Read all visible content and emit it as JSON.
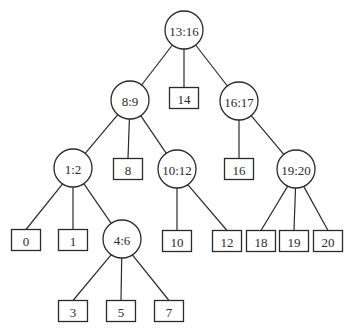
{
  "diagram": {
    "type": "tree",
    "colors": {
      "stroke": "#2a2a2a",
      "text": "#2a2a2a",
      "fill": "#ffffff",
      "background": "#ffffff"
    },
    "nodes": [
      {
        "id": "n13_16",
        "label": "13:16",
        "shape": "circle"
      },
      {
        "id": "n8_9",
        "label": "8:9",
        "shape": "circle"
      },
      {
        "id": "n14",
        "label": "14",
        "shape": "box"
      },
      {
        "id": "n16_17",
        "label": "16:17",
        "shape": "circle"
      },
      {
        "id": "n1_2",
        "label": "1:2",
        "shape": "circle"
      },
      {
        "id": "n8",
        "label": "8",
        "shape": "box"
      },
      {
        "id": "n10_12",
        "label": "10:12",
        "shape": "circle"
      },
      {
        "id": "n16",
        "label": "16",
        "shape": "box"
      },
      {
        "id": "n19_20",
        "label": "19:20",
        "shape": "circle"
      },
      {
        "id": "n0",
        "label": "0",
        "shape": "box"
      },
      {
        "id": "n1",
        "label": "1",
        "shape": "box"
      },
      {
        "id": "n4_6",
        "label": "4:6",
        "shape": "circle"
      },
      {
        "id": "n10",
        "label": "10",
        "shape": "box"
      },
      {
        "id": "n12",
        "label": "12",
        "shape": "box"
      },
      {
        "id": "n18",
        "label": "18",
        "shape": "box"
      },
      {
        "id": "n19",
        "label": "19",
        "shape": "box"
      },
      {
        "id": "n20",
        "label": "20",
        "shape": "box"
      },
      {
        "id": "n3",
        "label": "3",
        "shape": "box"
      },
      {
        "id": "n5",
        "label": "5",
        "shape": "box"
      },
      {
        "id": "n7",
        "label": "7",
        "shape": "box"
      }
    ],
    "edges": [
      [
        "n13_16",
        "n8_9"
      ],
      [
        "n13_16",
        "n14"
      ],
      [
        "n13_16",
        "n16_17"
      ],
      [
        "n8_9",
        "n1_2"
      ],
      [
        "n8_9",
        "n8"
      ],
      [
        "n8_9",
        "n10_12"
      ],
      [
        "n16_17",
        "n16"
      ],
      [
        "n16_17",
        "n19_20"
      ],
      [
        "n1_2",
        "n0"
      ],
      [
        "n1_2",
        "n1"
      ],
      [
        "n1_2",
        "n4_6"
      ],
      [
        "n10_12",
        "n10"
      ],
      [
        "n10_12",
        "n12"
      ],
      [
        "n19_20",
        "n18"
      ],
      [
        "n19_20",
        "n19"
      ],
      [
        "n19_20",
        "n20"
      ],
      [
        "n4_6",
        "n3"
      ],
      [
        "n4_6",
        "n5"
      ],
      [
        "n4_6",
        "n7"
      ]
    ]
  }
}
